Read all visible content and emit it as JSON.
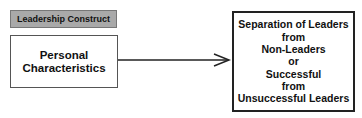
{
  "diagram": {
    "construct_label": "Leadership Construct",
    "source": {
      "lines": [
        "Personal",
        "Characteristics"
      ]
    },
    "arrow": {
      "icon": "arrow-right-icon"
    },
    "target": {
      "lines": [
        "Separation of Leaders",
        "from",
        "Non-Leaders",
        "or",
        "Successful",
        "from",
        "Unsuccessful Leaders"
      ]
    },
    "colors": {
      "label_bg": "#a9a9a9",
      "border": "#222222",
      "text": "#111111"
    }
  }
}
